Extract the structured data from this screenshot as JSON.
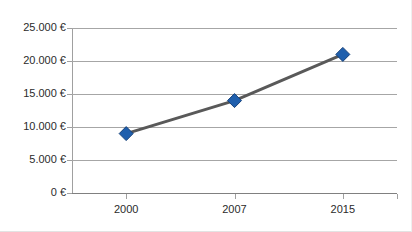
{
  "chart_data": {
    "type": "line",
    "title": "",
    "xlabel": "",
    "ylabel": "",
    "categories": [
      "2000",
      "2007",
      "2015"
    ],
    "x": [
      2000,
      2007,
      2015
    ],
    "series": [
      {
        "name": "",
        "values": [
          9000,
          14000,
          21000
        ],
        "marker": "diamond",
        "marker_color": "#1F5FAD",
        "line_color": "#595959"
      }
    ],
    "ylim": [
      0,
      25000
    ],
    "y_ticks": [
      0,
      5000,
      10000,
      15000,
      20000,
      25000
    ],
    "y_tick_labels": [
      "0 €",
      "5.000 €",
      "10.000 €",
      "15.000 €",
      "20.000 €",
      "25.000 €"
    ],
    "x_tick_labels": [
      "2000",
      "2007",
      "2015"
    ],
    "grid": true,
    "grid_axis": "y",
    "legend": false,
    "legend_position": "none",
    "currency_symbol": "€",
    "thousands_separator": "."
  },
  "axes": {
    "y_labels": [
      {
        "text": "25.000 €",
        "value": 25000
      },
      {
        "text": "20.000 €",
        "value": 20000
      },
      {
        "text": "15.000 €",
        "value": 15000
      },
      {
        "text": "10.000 €",
        "value": 10000
      },
      {
        "text": "5.000 €",
        "value": 5000
      },
      {
        "text": "0 €",
        "value": 0
      }
    ],
    "x_labels": [
      {
        "text": "2000",
        "value": 2000
      },
      {
        "text": "2007",
        "value": 2007
      },
      {
        "text": "2015",
        "value": 2015
      }
    ]
  },
  "colors": {
    "marker": "#1F5FAD",
    "marker_edge": "#16417A",
    "line": "#595959",
    "gridline": "#A6A6A6",
    "baseline": "#808080",
    "axis": "#A0A0A0",
    "text": "#2B2B2B",
    "background": "#FFFFFF"
  }
}
